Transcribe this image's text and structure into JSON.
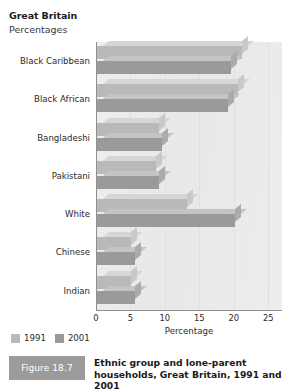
{
  "header": {
    "region": "Great Britain",
    "units": "Percentages"
  },
  "legend": {
    "position": "bottom-left",
    "items": [
      {
        "label": "1991",
        "color": "#b9b9b9"
      },
      {
        "label": "2001",
        "color": "#9a9a9a"
      }
    ]
  },
  "caption": {
    "badge": "Figure 18.7",
    "text": "Ethnic group and lone-parent households, Great Britain, 1991 and 2001"
  },
  "chart_data": {
    "type": "bar",
    "orientation": "horizontal",
    "title": "Ethnic group and lone-parent households, Great Britain, 1991 and 2001",
    "subtitle": "Great Britain",
    "units": "Percentages",
    "xlabel": "Percentage",
    "ylabel": "",
    "xlim": [
      0,
      27
    ],
    "xticks": [
      0,
      5,
      10,
      15,
      20,
      25
    ],
    "xtick_labels": [
      "0",
      "5",
      "10",
      "15",
      "20",
      "25"
    ],
    "grid": true,
    "legend_position": "bottom-left",
    "categories": [
      "Black Caribbean",
      "Black African",
      "Bangladeshi",
      "Pakistani",
      "White",
      "Chinese",
      "Indian"
    ],
    "series": [
      {
        "name": "1991",
        "color": "#b9b9b9",
        "values": [
          21,
          20.5,
          9,
          8.5,
          13,
          5,
          5
        ]
      },
      {
        "name": "2001",
        "color": "#9a9a9a",
        "values": [
          19.5,
          19,
          9.5,
          9,
          20,
          5.5,
          5.5
        ]
      }
    ]
  }
}
